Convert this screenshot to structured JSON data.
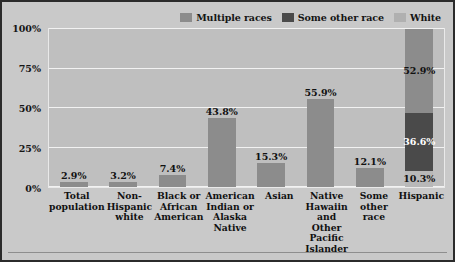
{
  "legend": {
    "entries": [
      {
        "label": "Multiple races",
        "color": "#8c8c8c",
        "icon": "legend-swatch-icon"
      },
      {
        "label": "Some other race",
        "color": "#4a4a4a",
        "icon": "legend-swatch-icon"
      },
      {
        "label": "White",
        "color": "#b0b0b0",
        "icon": "legend-swatch-icon"
      }
    ]
  },
  "axis": {
    "yticks": [
      "100%",
      "75%",
      "50%",
      "25%",
      "0%"
    ]
  },
  "colors": {
    "plot_background": "#bfbfbf",
    "figure_background": "#c9c9c9",
    "gridline": "#f2f2f2",
    "bar_default": "#8c8c8c",
    "frame": "#2b2b2b"
  },
  "chart_data": {
    "type": "bar",
    "title": "",
    "xlabel": "",
    "ylabel": "",
    "ylim": [
      0,
      100
    ],
    "yticks": [
      0,
      25,
      50,
      75,
      100
    ],
    "grid": true,
    "legend_position": "top-right",
    "categories": [
      "Total\npopulation",
      "Non-Hispanic\nwhite",
      "Black or\nAfrican\nAmerican",
      "American\nIndian or\nAlaska\nNative",
      "Asian",
      "Native Hawaiin\nand Other\nPacific\nIslander",
      "Some\nother\nrace",
      "Hispanic"
    ],
    "bars": [
      {
        "category": "Total population",
        "stacked": false,
        "segments": [
          {
            "series": "Multiple races",
            "value": 2.9,
            "label": "2.9%",
            "color": "#8c8c8c",
            "label_position": "above"
          }
        ]
      },
      {
        "category": "Non-Hispanic white",
        "stacked": false,
        "segments": [
          {
            "series": "Multiple races",
            "value": 3.2,
            "label": "3.2%",
            "color": "#8c8c8c",
            "label_position": "above"
          }
        ]
      },
      {
        "category": "Black or African American",
        "stacked": false,
        "segments": [
          {
            "series": "Multiple races",
            "value": 7.4,
            "label": "7.4%",
            "color": "#8c8c8c",
            "label_position": "above"
          }
        ]
      },
      {
        "category": "American Indian or Alaska Native",
        "stacked": false,
        "segments": [
          {
            "series": "Multiple races",
            "value": 43.8,
            "label": "43.8%",
            "color": "#8c8c8c",
            "label_position": "above"
          }
        ]
      },
      {
        "category": "Asian",
        "stacked": false,
        "segments": [
          {
            "series": "Multiple races",
            "value": 15.3,
            "label": "15.3%",
            "color": "#8c8c8c",
            "label_position": "above"
          }
        ]
      },
      {
        "category": "Native Hawaiin and Other Pacific Islander",
        "stacked": false,
        "segments": [
          {
            "series": "Multiple races",
            "value": 55.9,
            "label": "55.9%",
            "color": "#8c8c8c",
            "label_position": "above"
          }
        ]
      },
      {
        "category": "Some other race",
        "stacked": false,
        "segments": [
          {
            "series": "Multiple races",
            "value": 12.1,
            "label": "12.1%",
            "color": "#8c8c8c",
            "label_position": "above"
          }
        ]
      },
      {
        "category": "Hispanic",
        "stacked": true,
        "segments": [
          {
            "series": "White",
            "value": 52.9,
            "label": "52.9%",
            "color": "#8c8c8c",
            "label_position": "inside-dark"
          },
          {
            "series": "Some other race",
            "value": 36.6,
            "label": "36.6%",
            "color": "#4a4a4a",
            "label_position": "inside"
          },
          {
            "series": "Multiple races",
            "value": 10.3,
            "label": "10.3%",
            "color": "#b8b8b8",
            "label_position": "inside-dark"
          }
        ]
      }
    ]
  }
}
